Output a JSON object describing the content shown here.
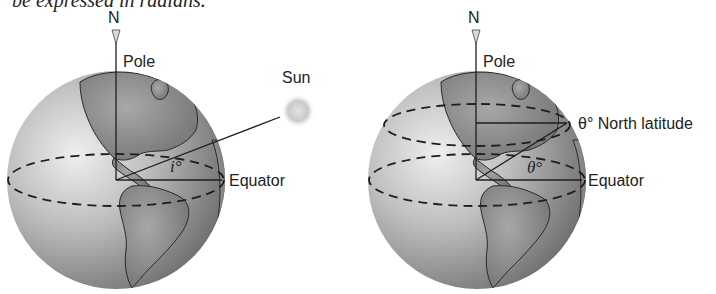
{
  "caption": "be expressed in radians.",
  "left_figure": {
    "north_label": "N",
    "pole_label": "Pole",
    "sun_label": "Sun",
    "angle_label": "i°",
    "equator_label": "Equator"
  },
  "right_figure": {
    "north_label": "N",
    "pole_label": "Pole",
    "latitude_label": "θ° North latitude",
    "angle_label": "θ°",
    "equator_label": "Equator"
  },
  "colors": {
    "globe_light": "#e6e6e6",
    "globe_dark": "#6e6e6e",
    "land": "#8a8a8a",
    "line": "#1e1e1e",
    "sun": "#c8c8c8"
  }
}
